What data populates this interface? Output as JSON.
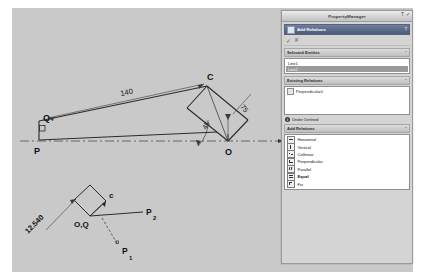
{
  "panel": {
    "window_title": "PropertyManager",
    "titlebar_icons": [
      "text-icon",
      "check-icon"
    ],
    "header": {
      "icon": "add-relations-icon",
      "title": "Add Relations",
      "pin": "?"
    },
    "toolbar": {
      "accept_label": "✓",
      "cancel_label": "✘"
    },
    "selected_entities": {
      "section_title": "Selected Entities",
      "collapse": "⌃",
      "items": [
        {
          "label": "Line1",
          "selected": false
        },
        {
          "label": "Line2",
          "selected": true
        }
      ]
    },
    "existing_relations": {
      "section_title": "Existing Relations",
      "collapse": "⌃",
      "items": [
        {
          "label": "Perpendicular0",
          "icon": "perpendicular-icon"
        }
      ]
    },
    "status": {
      "icon": "info-icon",
      "badge": "i",
      "text": "Under Defined"
    },
    "add_relations": {
      "section_title": "Add Relations",
      "collapse": "⌃",
      "items": [
        {
          "label": "Horizontal",
          "icon": "horizontal-icon"
        },
        {
          "label": "Vertical",
          "icon": "vertical-icon"
        },
        {
          "label": "Collinear",
          "icon": "collinear-icon"
        },
        {
          "label": "Perpendicular",
          "icon": "perpendicular-icon"
        },
        {
          "label": "Parallel",
          "icon": "parallel-icon"
        },
        {
          "label": "Equal",
          "icon": "equal-icon"
        },
        {
          "label": "Fix",
          "icon": "fix-icon"
        }
      ]
    }
  },
  "sketch": {
    "main": {
      "point_p": "P",
      "point_q": "Q",
      "point_c": "C",
      "point_o": "O",
      "dim_length": "140",
      "dim_side": "75",
      "dim_angle": "45"
    },
    "detail": {
      "label_c": "c",
      "label_oq": "O,Q",
      "label_p2": "P",
      "label_p2_sub": "2",
      "label_p1": "P",
      "label_p1_sub": "1",
      "dim_rotated": "12.540"
    }
  },
  "colors": {
    "canvas": "#c9c9c9",
    "panel": "#d4d4d4",
    "header_blue": "#4a5a78",
    "geometry": "#2b2b2b",
    "selection": "#9a9a9a"
  }
}
